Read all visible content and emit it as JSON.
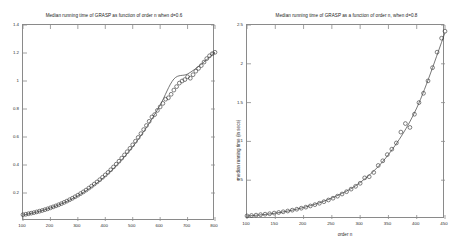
{
  "figures": [
    {
      "id": "left",
      "title": "Median running time of GRASP as function of order n when  d=0.6",
      "chart_data": {
        "type": "scatter",
        "title": "Median running time of GRASP as function of order n when  d=0.6",
        "xlabel": "",
        "ylabel": "",
        "xlim": [
          100,
          800
        ],
        "ylim": [
          0,
          1.4
        ],
        "xticks": [
          100,
          200,
          300,
          400,
          500,
          600,
          700,
          800
        ],
        "yticks": [
          0.2,
          0.4,
          0.6,
          0.8,
          1,
          1.2,
          1.4
        ],
        "xtick_labels": [
          "100",
          "200",
          "300",
          "400",
          "500",
          "600",
          "700",
          "800"
        ],
        "ytick_labels": [
          "0.2",
          "0.4",
          "0.6",
          "0.8",
          "1",
          "1.2",
          "1.4"
        ],
        "grid": false,
        "legend": "none",
        "marker": "circle-open",
        "series": [
          {
            "name": "measured median running time",
            "style": "markers",
            "x": [
              100,
              110,
              120,
              130,
              140,
              150,
              160,
              170,
              180,
              190,
              200,
              210,
              220,
              230,
              240,
              250,
              260,
              270,
              280,
              290,
              300,
              310,
              320,
              330,
              340,
              350,
              360,
              370,
              380,
              390,
              400,
              410,
              420,
              430,
              440,
              450,
              460,
              470,
              480,
              490,
              500,
              510,
              520,
              530,
              540,
              550,
              560,
              570,
              580,
              590,
              600,
              610,
              620,
              630,
              640,
              650,
              660,
              670,
              680,
              690,
              700,
              710,
              720,
              730,
              740,
              750,
              760,
              770,
              780,
              790,
              800
            ],
            "y": [
              0.045,
              0.048,
              0.052,
              0.056,
              0.06,
              0.065,
              0.07,
              0.075,
              0.081,
              0.087,
              0.094,
              0.101,
              0.108,
              0.116,
              0.124,
              0.133,
              0.142,
              0.152,
              0.162,
              0.173,
              0.184,
              0.196,
              0.208,
              0.221,
              0.235,
              0.249,
              0.264,
              0.279,
              0.295,
              0.312,
              0.329,
              0.347,
              0.366,
              0.386,
              0.406,
              0.427,
              0.449,
              0.472,
              0.495,
              0.519,
              0.544,
              0.57,
              0.597,
              0.624,
              0.653,
              0.682,
              0.712,
              0.743,
              0.76,
              0.79,
              0.815,
              0.84,
              0.87,
              0.88,
              0.905,
              0.935,
              0.96,
              0.985,
              1.0,
              1.01,
              1.03,
              1.02,
              1.045,
              1.07,
              1.09,
              1.11,
              1.135,
              1.16,
              1.18,
              1.195,
              1.205
            ]
          },
          {
            "name": "fitted curve",
            "style": "line",
            "x": [
              100,
              150,
              200,
              250,
              300,
              350,
              400,
              450,
              500,
              550,
              600,
              650,
              700,
              750,
              800
            ],
            "y": [
              0.042,
              0.064,
              0.093,
              0.131,
              0.18,
              0.243,
              0.32,
              0.416,
              0.531,
              0.668,
              0.828,
              1.014,
              1.05,
              1.12,
              1.205
            ]
          }
        ]
      }
    },
    {
      "id": "right",
      "title": "Median running time of GRASP as a function of order n, when d=0.8",
      "chart_data": {
        "type": "scatter",
        "title": "Median running time of GRASP as a function of order n, when d=0.8",
        "xlabel": "order n",
        "ylabel": "median running time (in secs)",
        "xlim": [
          100,
          450
        ],
        "ylim": [
          0,
          2.5
        ],
        "xticks": [
          100,
          150,
          200,
          250,
          300,
          350,
          400,
          450
        ],
        "yticks": [
          0.5,
          1,
          1.5,
          2,
          2.5
        ],
        "xtick_labels": [
          "100",
          "150",
          "200",
          "250",
          "300",
          "350",
          "400",
          "450"
        ],
        "ytick_labels": [
          "0.5",
          "1",
          "1.5",
          "2",
          "2.5"
        ],
        "grid": false,
        "legend": "none",
        "marker": "circle-open",
        "series": [
          {
            "name": "measured median running time",
            "style": "markers",
            "x": [
              100,
              108,
              116,
              124,
              132,
              140,
              148,
              156,
              164,
              172,
              180,
              188,
              196,
              204,
              212,
              220,
              228,
              236,
              244,
              252,
              260,
              268,
              276,
              284,
              292,
              300,
              308,
              316,
              324,
              332,
              340,
              348,
              356,
              364,
              372,
              380,
              388,
              396,
              404,
              412,
              420,
              428,
              436,
              444,
              450
            ],
            "y": [
              0.04,
              0.045,
              0.05,
              0.056,
              0.062,
              0.068,
              0.076,
              0.084,
              0.093,
              0.103,
              0.114,
              0.126,
              0.139,
              0.153,
              0.168,
              0.185,
              0.203,
              0.223,
              0.245,
              0.268,
              0.294,
              0.322,
              0.352,
              0.385,
              0.421,
              0.46,
              0.53,
              0.545,
              0.6,
              0.69,
              0.75,
              0.83,
              0.9,
              0.98,
              1.12,
              1.23,
              1.18,
              1.35,
              1.5,
              1.62,
              1.78,
              1.95,
              2.15,
              2.33,
              2.42
            ]
          },
          {
            "name": "fitted curve",
            "style": "line",
            "x": [
              100,
              150,
              200,
              250,
              300,
              350,
              400,
              450
            ],
            "y": [
              0.038,
              0.075,
              0.148,
              0.27,
              0.47,
              0.83,
              1.43,
              2.4
            ]
          }
        ]
      }
    }
  ]
}
